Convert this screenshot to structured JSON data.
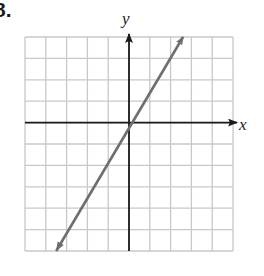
{
  "problem": {
    "number": "8."
  },
  "colors": {
    "grid": "#c8c8c8",
    "axis": "#1a1a1a",
    "line": "#6e6e6e"
  },
  "chart_data": {
    "type": "line",
    "title": "",
    "xlabel": "x",
    "ylabel": "y",
    "xlim": [
      -5,
      5
    ],
    "ylim": [
      -6,
      4
    ],
    "grid": true,
    "tick_labels": false,
    "equation": "y = 1.5x",
    "series": [
      {
        "name": "line",
        "x": [
          -3.5,
          0,
          2.6
        ],
        "y": [
          -6,
          0,
          4
        ],
        "arrows": "both"
      }
    ],
    "legend": null
  }
}
